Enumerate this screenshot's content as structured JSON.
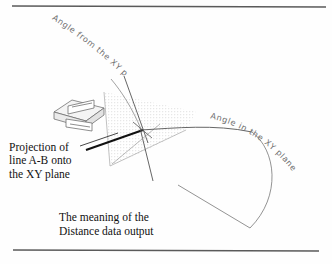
{
  "figure": {
    "labels": {
      "angle_from_xy_plane": "Angle from the XY plane",
      "angle_from_xy_plane_chars": [
        "A",
        "n",
        "g",
        "l",
        "e",
        " ",
        "f",
        "r",
        "o",
        "m",
        " ",
        "t",
        "h",
        "e",
        " ",
        "X",
        "Y",
        " ",
        "p",
        "l",
        "a",
        "n",
        "e"
      ],
      "angle_in_xy_plane": "Angle in the XY plane",
      "angle_in_xy_plane_chars": [
        "A",
        "n",
        "g",
        "l",
        "e",
        " ",
        "i",
        "n",
        " ",
        "t",
        "h",
        "e",
        " ",
        "X",
        "Y",
        " ",
        "p",
        "l",
        "a",
        "n",
        "e"
      ]
    },
    "projection_caption": {
      "line1": "Projection of",
      "line2": "line A-B onto",
      "line3": "the XY plane"
    },
    "meaning_caption": {
      "line1": "The meaning of the",
      "line2": "Distance data output"
    },
    "colors": {
      "ink": "#1a1a1a",
      "rule": "#5a5a5a",
      "plane_stipple": "#b9b9b9",
      "thin_line": "#7d7d7d",
      "handwriting": "#6e6e6e",
      "bold_line": "#111111",
      "paper": "#fefefe"
    }
  }
}
